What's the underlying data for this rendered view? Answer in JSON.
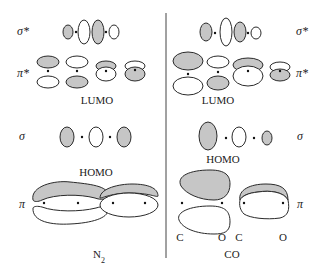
{
  "figure": {
    "colors": {
      "shaded_lobe": "#c6c6c6",
      "open_lobe": "#ffffff",
      "outline": "#2a2a2a",
      "divider": "#444444"
    },
    "left_panel": {
      "molecule_label": "N",
      "molecule_subscript": "2",
      "rows": [
        {
          "symbol": "σ*",
          "id": "sigma-star"
        },
        {
          "symbol": "π*",
          "id": "pi-star",
          "tag": "LUMO"
        },
        {
          "symbol": "σ",
          "id": "sigma",
          "tag": "HOMO"
        },
        {
          "symbol": "π",
          "id": "pi"
        }
      ]
    },
    "right_panel": {
      "molecule_label": "CO",
      "rows": [
        {
          "symbol": "σ*",
          "id": "sigma-star"
        },
        {
          "symbol": "π*",
          "id": "pi-star",
          "tag": "LUMO"
        },
        {
          "symbol": "σ",
          "id": "sigma",
          "tag": "HOMO"
        },
        {
          "symbol": "π",
          "id": "pi"
        }
      ],
      "atom_labels": [
        "C",
        "O",
        "C",
        "O"
      ]
    }
  }
}
